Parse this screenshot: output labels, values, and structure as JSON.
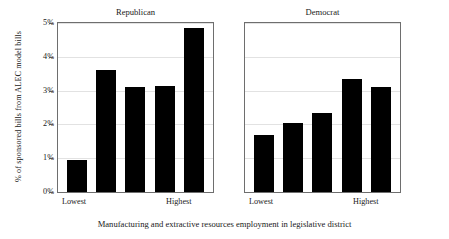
{
  "chart_data": {
    "type": "bar",
    "title": "",
    "xlabel": "Manufacturing and extractive resources employment in legislative district",
    "ylabel": "% of sponsored bills from ALEC model bills",
    "ylim": [
      0,
      5
    ],
    "yticks": [
      "0%",
      "1%",
      "2%",
      "3%",
      "4%",
      "5%"
    ],
    "ytick_values": [
      0,
      1,
      2,
      3,
      4,
      5
    ],
    "grid": true,
    "legend": "none",
    "categories": [
      "Lowest",
      "2",
      "3",
      "4",
      "Highest"
    ],
    "xtick_labels_shown": [
      "Lowest",
      "Highest"
    ],
    "panels": [
      {
        "name": "Republican",
        "values": [
          0.95,
          3.6,
          3.1,
          3.15,
          4.85
        ]
      },
      {
        "name": "Democrat",
        "values": [
          1.68,
          2.03,
          2.33,
          3.35,
          3.1
        ]
      }
    ],
    "bar_color": "#000000",
    "panel_border_color": "#6e6e6e",
    "gridline_color": "#e2e2e2"
  },
  "axis": {
    "y_title": "% of sponsored bills from ALEC model bills",
    "ticks": [
      {
        "label": "5%",
        "value": 5
      },
      {
        "label": "4%",
        "value": 4
      },
      {
        "label": "3%",
        "value": 3
      },
      {
        "label": "2%",
        "value": 2
      },
      {
        "label": "1%",
        "value": 1
      },
      {
        "label": "0%",
        "value": 0
      }
    ]
  },
  "panels": {
    "republican": {
      "title": "Republican",
      "x_low_label": "Lowest",
      "x_high_label": "Highest"
    },
    "democrat": {
      "title": "Democrat",
      "x_low_label": "Lowest",
      "x_high_label": "Highest"
    }
  },
  "caption": "Manufacturing and extractive resources employment in legislative district"
}
